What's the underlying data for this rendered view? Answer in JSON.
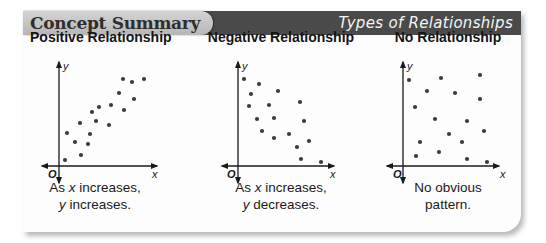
{
  "header": {
    "tab_label": "Concept Summary",
    "title": "Types of Relationships",
    "bar_color": "#4a4a4a",
    "tab_color": "#c4c4c4"
  },
  "panels": [
    {
      "title": "Positive Relationship",
      "caption_line1_pre": "As ",
      "caption_line1_var": "x",
      "caption_line1_post": " increases,",
      "caption_line2_var": "y",
      "caption_line2_post": " increases.",
      "origin_label": "O",
      "x_label": "x",
      "y_label": "y"
    },
    {
      "title": "Negative Relationship",
      "caption_line1_pre": "As ",
      "caption_line1_var": "x",
      "caption_line1_post": " increases,",
      "caption_line2_var": "y",
      "caption_line2_post": " decreases.",
      "origin_label": "O",
      "x_label": "x",
      "y_label": "y"
    },
    {
      "title": "No Relationship",
      "caption_line1": "No obvious",
      "caption_line2": "pattern.",
      "origin_label": "O",
      "x_label": "x",
      "y_label": "y"
    }
  ],
  "chart_data": [
    {
      "type": "scatter",
      "title": "Positive Relationship",
      "xlabel": "x",
      "ylabel": "y",
      "note": "Pixel coordinates relative to the scatter plot's origin (x right, y up)",
      "points": [
        [
          6,
          6
        ],
        [
          22,
          11
        ],
        [
          8,
          33
        ],
        [
          16,
          24
        ],
        [
          29,
          22
        ],
        [
          31,
          32
        ],
        [
          21,
          43
        ],
        [
          37,
          45
        ],
        [
          33,
          54
        ],
        [
          40,
          59
        ],
        [
          50,
          41
        ],
        [
          52,
          61
        ],
        [
          65,
          56
        ],
        [
          60,
          73
        ],
        [
          75,
          67
        ],
        [
          64,
          87
        ],
        [
          73,
          84
        ],
        [
          85,
          87
        ]
      ]
    },
    {
      "type": "scatter",
      "title": "Negative Relationship",
      "xlabel": "x",
      "ylabel": "y",
      "note": "Pixel coordinates relative to the scatter plot's origin (x right, y up)",
      "points": [
        [
          6,
          87
        ],
        [
          21,
          82
        ],
        [
          13,
          72
        ],
        [
          40,
          75
        ],
        [
          11,
          60
        ],
        [
          31,
          61
        ],
        [
          62,
          64
        ],
        [
          19,
          47
        ],
        [
          36,
          48
        ],
        [
          66,
          45
        ],
        [
          24,
          35
        ],
        [
          51,
          32
        ],
        [
          36,
          28
        ],
        [
          71,
          25
        ],
        [
          59,
          19
        ],
        [
          63,
          7
        ],
        [
          83,
          4
        ]
      ]
    },
    {
      "type": "scatter",
      "title": "No Relationship",
      "xlabel": "x",
      "ylabel": "y",
      "note": "Pixel coordinates relative to the scatter plot's origin (x right, y up)",
      "points": [
        [
          6,
          86
        ],
        [
          38,
          88
        ],
        [
          77,
          91
        ],
        [
          24,
          75
        ],
        [
          52,
          73
        ],
        [
          77,
          67
        ],
        [
          12,
          59
        ],
        [
          32,
          47
        ],
        [
          64,
          45
        ],
        [
          81,
          35
        ],
        [
          46,
          32
        ],
        [
          17,
          24
        ],
        [
          59,
          24
        ],
        [
          36,
          14
        ],
        [
          13,
          10
        ],
        [
          64,
          7
        ],
        [
          84,
          4
        ]
      ]
    }
  ]
}
